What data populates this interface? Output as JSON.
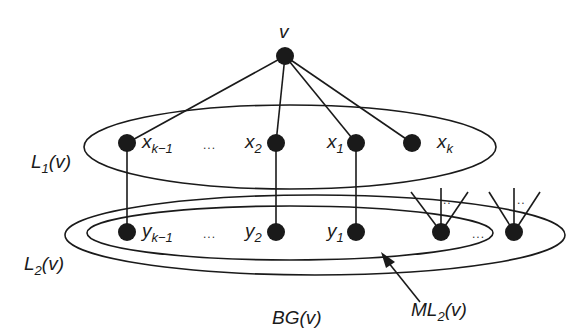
{
  "diagram": {
    "root": {
      "label": "v"
    },
    "layer1": {
      "set_label": "L",
      "set_sub": "1",
      "set_arg": "(v)",
      "nodes": [
        {
          "base": "x",
          "sub": "k−1"
        },
        {
          "base": "x",
          "sub": "2"
        },
        {
          "base": "x",
          "sub": "1"
        },
        {
          "base": "x",
          "sub": "k"
        }
      ],
      "ellipsis": "..."
    },
    "layer2": {
      "set_label": "L",
      "set_sub": "2",
      "set_arg": "(v)",
      "nodes": [
        {
          "base": "y",
          "sub": "k−1"
        },
        {
          "base": "y",
          "sub": "2"
        },
        {
          "base": "y",
          "sub": "1"
        }
      ],
      "ellipsis": "...",
      "extra_ellipsis": "...",
      "fan_ellipsis": ".."
    },
    "subset_label": {
      "base": "ML",
      "sub": "2",
      "arg": "(v)"
    },
    "graph_label": "BG(v)",
    "colors": {
      "ink": "#1a1a1a",
      "background": "#ffffff"
    }
  }
}
